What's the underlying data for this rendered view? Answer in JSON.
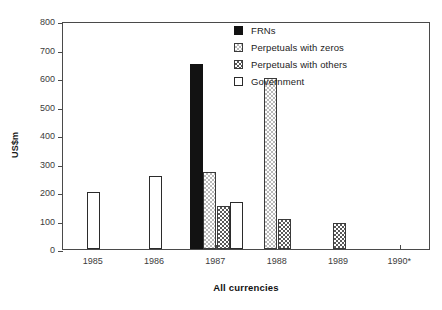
{
  "chart_data": {
    "type": "bar",
    "title": "",
    "xlabel": "All currencies",
    "ylabel": "US$m",
    "categories": [
      "1985",
      "1986",
      "1987",
      "1988",
      "1989",
      "1990*"
    ],
    "ylim": [
      0,
      800
    ],
    "ytick_step": 100,
    "yticks": [
      "800",
      "700",
      "600",
      "500",
      "400",
      "300",
      "200",
      "100",
      "0"
    ],
    "grid": false,
    "legend_position": "top-right",
    "series": [
      {
        "name": "FRNs",
        "color": "#121212",
        "pattern": "solid",
        "values": [
          0,
          0,
          650,
          0,
          0,
          0
        ]
      },
      {
        "name": "Perpetuals with zeros",
        "color": "#b9b9b9",
        "pattern": "light-checker",
        "values": [
          0,
          0,
          270,
          600,
          0,
          0
        ]
      },
      {
        "name": "Perpetuals with others",
        "color": "#585858",
        "pattern": "dark-checker",
        "values": [
          0,
          0,
          150,
          105,
          90,
          0
        ]
      },
      {
        "name": "Government",
        "color": "#ffffff",
        "pattern": "open",
        "values": [
          200,
          255,
          165,
          0,
          0,
          0
        ]
      }
    ]
  },
  "legend": {
    "items": [
      {
        "label": "FRNs",
        "key": "frns"
      },
      {
        "label": "Perpetuals with zeros",
        "key": "zeros"
      },
      {
        "label": "Perpetuals with others",
        "key": "others"
      },
      {
        "label": "Government",
        "key": "government"
      }
    ]
  }
}
